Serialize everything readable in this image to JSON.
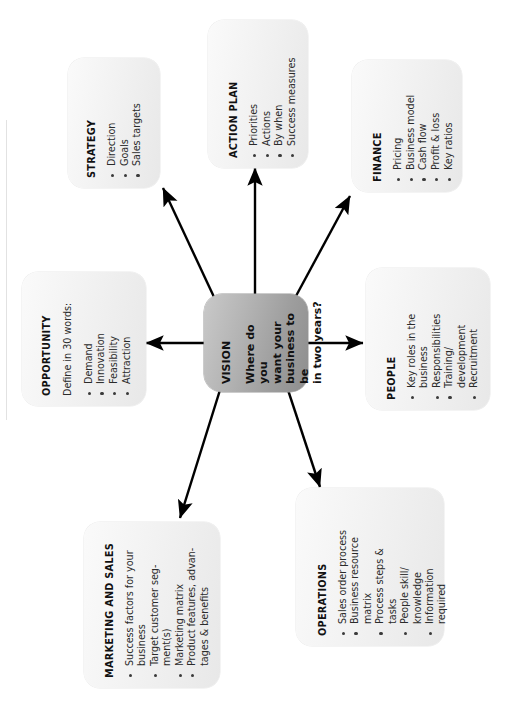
{
  "diagram": {
    "center": {
      "label": "VISION",
      "question": "Where do you\nwant your\nbusiness to be\nin two years?"
    },
    "nodes": [
      {
        "id": "strategy",
        "title": "STRATEGY",
        "subtitle": "",
        "bullets": [
          "Direction",
          "Goals",
          "Sales targets"
        ]
      },
      {
        "id": "action-plan",
        "title": "ACTION PLAN",
        "subtitle": "",
        "bullets": [
          "Priorities",
          "Actions",
          "By when",
          "Success measures"
        ]
      },
      {
        "id": "finance",
        "title": "FINANCE",
        "subtitle": "",
        "bullets": [
          "Pricing",
          "Business model",
          "Cash flow",
          "Profit & loss",
          "Key ratios"
        ]
      },
      {
        "id": "opportunity",
        "title": "OPPORTUNITY",
        "subtitle": "Define in 30 words:",
        "bullets": [
          "Demand",
          "Innovation",
          "Feasibility",
          "Attraction"
        ]
      },
      {
        "id": "people",
        "title": "PEOPLE",
        "subtitle": "",
        "bullets": [
          "Key roles in the\nbusiness",
          "Responsibilities",
          "Training/\ndevelopment",
          "Recruitment"
        ]
      },
      {
        "id": "operations",
        "title": "OPERATIONS",
        "subtitle": "",
        "bullets": [
          "Sales order process",
          "Business resource\nmatrix",
          "Process steps &\ntasks",
          "People skill/\nknowledge",
          "Information\nrequired"
        ]
      },
      {
        "id": "marketing-and-sales",
        "title": "MARKETING AND SALES",
        "subtitle": "",
        "bullets": [
          "Success factors for your\nbusiness",
          "Target customer seg-\nment(s)",
          "Marketing matrix",
          "Product features, advan-\ntages & benefits"
        ]
      }
    ],
    "colors": {
      "page_background": "#ffffff",
      "card_fill_light": "#fafafa",
      "card_fill_dark": "#e8e8e8",
      "center_fill_light": "#c9c9c9",
      "center_fill_dark": "#8e8e8e",
      "text": "#2b2b2b",
      "arrow": "#000000"
    },
    "connectors": [
      {
        "from": "vision",
        "to": "strategy",
        "direction": "up-left"
      },
      {
        "from": "vision",
        "to": "action-plan",
        "direction": "up"
      },
      {
        "from": "vision",
        "to": "finance",
        "direction": "up-right"
      },
      {
        "from": "vision",
        "to": "opportunity",
        "direction": "left"
      },
      {
        "from": "vision",
        "to": "people",
        "direction": "right"
      },
      {
        "from": "vision",
        "to": "marketing-and-sales",
        "direction": "down-left"
      },
      {
        "from": "vision",
        "to": "operations",
        "direction": "down-right"
      }
    ]
  }
}
